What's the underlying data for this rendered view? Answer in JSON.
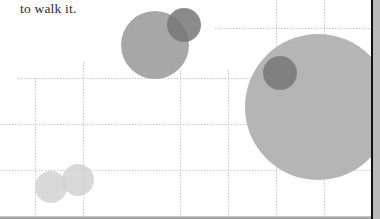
{
  "caption": {
    "text": "to walk it."
  },
  "colors": {
    "grid": "#c8c8c8",
    "bubble_medium": "#a7a7a7",
    "bubble_dark": "#777777",
    "bubble_large": "#b5b5b5",
    "bubble_light": "#d2d2d2",
    "right_bar": "#111111",
    "right_strip": "#b9b9b9"
  },
  "chart_data": {
    "type": "scatter",
    "subtype": "bubble",
    "title": "",
    "xlabel": "",
    "ylabel": "",
    "grid": true,
    "legend": "none",
    "grid_lines": {
      "horizontal_y_px": [
        28,
        78,
        124,
        170
      ],
      "vertical_x_px": [
        35,
        83,
        180,
        228,
        276,
        324
      ]
    },
    "bubbles": [
      {
        "cx": 155,
        "cy": 45,
        "r": 34,
        "shade": "medium"
      },
      {
        "cx": 184,
        "cy": 25,
        "r": 17,
        "shade": "dark"
      },
      {
        "cx": 318,
        "cy": 107,
        "r": 73,
        "shade": "large"
      },
      {
        "cx": 280,
        "cy": 73,
        "r": 17,
        "shade": "dark"
      },
      {
        "cx": 51,
        "cy": 187,
        "r": 16,
        "shade": "light"
      },
      {
        "cx": 78,
        "cy": 180,
        "r": 16,
        "shade": "light"
      }
    ]
  }
}
